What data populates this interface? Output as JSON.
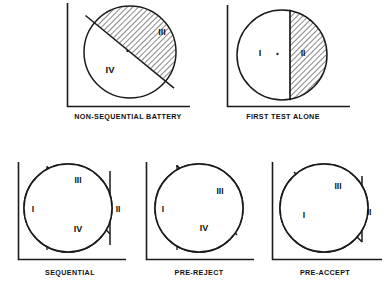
{
  "figure": {
    "kind": "region-diagram-set",
    "background_color": "#ffffff",
    "ink_color": "#1a1a1a",
    "panel_count": 5,
    "region_labels": [
      "I",
      "II",
      "III",
      "IV"
    ],
    "hatch_style": "45-degree diagonal line hatching"
  },
  "panels": [
    {
      "id": "non-sequential-battery",
      "caption": "NON-SEQUENTIAL  BATTERY",
      "row": 1,
      "split_type": "single-diagonal",
      "has_center_dot": true,
      "has_dashed_line": false,
      "regions": [
        {
          "label": "III",
          "fill": "hatched",
          "position": "upper-right"
        },
        {
          "label": "IV",
          "fill": "white",
          "position": "lower-left"
        }
      ]
    },
    {
      "id": "first-test-alone",
      "caption": "FIRST  TEST  ALONE",
      "row": 1,
      "split_type": "single-vertical",
      "has_center_dot": true,
      "has_dashed_line": false,
      "regions": [
        {
          "label": "I",
          "fill": "white",
          "position": "left"
        },
        {
          "label": "II",
          "fill": "hatched",
          "position": "right"
        }
      ]
    },
    {
      "id": "sequential",
      "caption": "SEQUENTIAL",
      "row": 2,
      "split_type": "dashed-vertical-plus-diagonal-plus-vertical",
      "has_center_dot": false,
      "has_dashed_line": true,
      "regions": [
        {
          "label": "I",
          "fill": "white",
          "position": "left"
        },
        {
          "label": "III",
          "fill": "hatched",
          "position": "top-center"
        },
        {
          "label": "II",
          "fill": "hatched",
          "position": "right-strip"
        },
        {
          "label": "IV",
          "fill": "white",
          "position": "bottom-center"
        }
      ]
    },
    {
      "id": "pre-reject",
      "caption": "PRE-REJECT",
      "row": 2,
      "split_type": "dashed-vertical-plus-diagonal",
      "has_center_dot": false,
      "has_dashed_line": true,
      "regions": [
        {
          "label": "I",
          "fill": "white",
          "position": "left"
        },
        {
          "label": "III",
          "fill": "hatched",
          "position": "upper-right"
        },
        {
          "label": "IV",
          "fill": "white",
          "position": "bottom-center"
        }
      ]
    },
    {
      "id": "pre-accept",
      "caption": "PRE-ACCEPT",
      "row": 2,
      "split_type": "diagonal-plus-vertical",
      "has_center_dot": false,
      "has_dashed_line": false,
      "regions": [
        {
          "label": "I",
          "fill": "white",
          "position": "left"
        },
        {
          "label": "III",
          "fill": "hatched",
          "position": "upper-right"
        },
        {
          "label": "II",
          "fill": "hatched",
          "position": "right-strip"
        }
      ]
    }
  ],
  "captions": {
    "p1": "NON-SEQUENTIAL  BATTERY",
    "p2": "FIRST  TEST  ALONE",
    "p3": "SEQUENTIAL",
    "p4": "PRE-REJECT",
    "p5": "PRE-ACCEPT"
  },
  "labels": {
    "I": "I",
    "II": "II",
    "III": "III",
    "IV": "IV"
  }
}
